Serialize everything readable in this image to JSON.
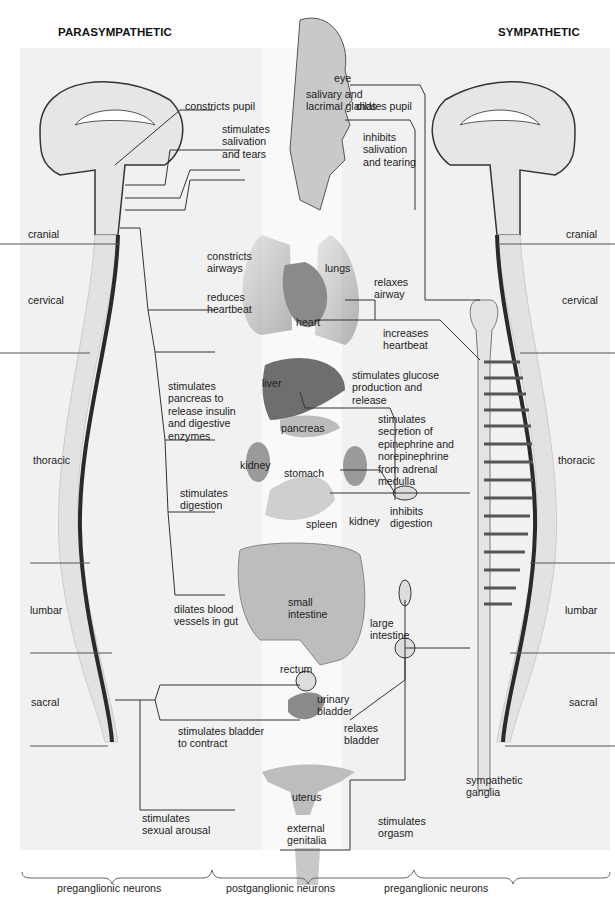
{
  "headings": {
    "left": "PARASYMPATHETIC",
    "right": "SYMPATHETIC"
  },
  "regions_left": {
    "cranial": "cranial",
    "cervical": "cervical",
    "thoracic": "thoracic",
    "lumbar": "lumbar",
    "sacral": "sacral"
  },
  "regions_right": {
    "cranial": "cranial",
    "cervical": "cervical",
    "thoracic": "thoracic",
    "lumbar": "lumbar",
    "sacral": "sacral"
  },
  "organs": {
    "eye": "eye",
    "glands": "salivary and\nlacrimal glands",
    "lungs": "lungs",
    "heart": "heart",
    "liver": "liver",
    "pancreas": "pancreas",
    "kidney_left": "kidney",
    "stomach": "stomach",
    "kidney_right": "kidney",
    "spleen": "spleen",
    "small_intestine": "small\nintestine",
    "large_intestine": "large\nintestine",
    "rectum": "rectum",
    "urinary_bladder": "urinary\nbladder",
    "uterus": "uterus",
    "external_genitalia": "external\ngenitalia",
    "sympathetic_ganglia": "sympathetic\nganglia"
  },
  "parasympathetic_effects": {
    "pupil": "constricts pupil",
    "salivation": "stimulates\nsalivation\nand tears",
    "airways": "constricts\nairways",
    "heartbeat": "reduces\nheartbeat",
    "pancreas": "stimulates\npancreas to\nrelease insulin\nand digestive\nenzymes",
    "digestion": "stimulates\ndigestion",
    "gut": "dilates blood\nvessels in gut",
    "bladder": "stimulates bladder\nto contract",
    "arousal": "stimulates\nsexual arousal"
  },
  "sympathetic_effects": {
    "pupil": "dilates pupil",
    "salivation": "inhibits\nsalivation\nand tearing",
    "airway": "relaxes\nairway",
    "heartbeat": "increases\nheartbeat",
    "glucose": "stimulates glucose\nproduction and\nrelease",
    "adrenal": "stimulates\nsecretion of\nepinephrine and\nnorepinephrine\nfrom adrenal\nmedulla",
    "digestion": "inhibits\ndigestion",
    "bladder": "relaxes\nbladder",
    "orgasm": "stimulates\norgasm"
  },
  "footer": {
    "left": "preganglionic neurons",
    "middle": "postganglionic neurons",
    "right": "preganglionic neurons"
  },
  "colors": {
    "panel": "#f1f1f1",
    "organ": "#8a8a8a",
    "nerve": "#333333",
    "cord": "#e0e0e0"
  }
}
